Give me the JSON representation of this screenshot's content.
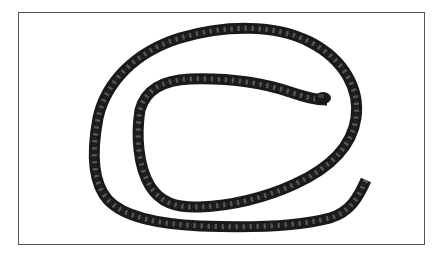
{
  "image": {
    "subject": "coiled braided black rope",
    "background_color": "#ffffff",
    "frame_color": "#555555",
    "rope_color": "#1a1a1a",
    "rope_highlight_color": "#6e6e6e"
  }
}
